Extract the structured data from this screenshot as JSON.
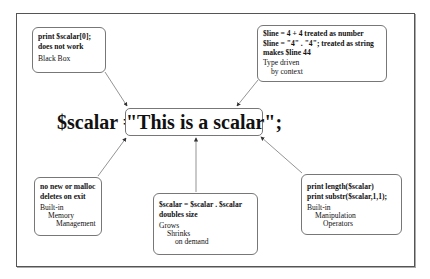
{
  "diagram": {
    "center": {
      "left_text": "$scalar =",
      "boxed_text": "\"This is a scalar\";"
    },
    "notes": {
      "top_left": {
        "code_lines": [
          "print $scalar[0];",
          "does not work"
        ],
        "label_lines": [
          "Black Box"
        ]
      },
      "top_right": {
        "code_lines": [
          "$line = 4 + 4 treated as number",
          "$line = \"4\" . \"4\"; treated as string",
          "makes $line 44"
        ],
        "label_lines": [
          "Type driven",
          "by context"
        ]
      },
      "bottom_left": {
        "code_lines": [
          "no new or malloc",
          "deletes on exit"
        ],
        "label_lines": [
          "Built-in",
          "Memory",
          "Management"
        ]
      },
      "bottom_center": {
        "code_lines": [
          "$scalar = $scalar . $scalar",
          "doubles size"
        ],
        "label_lines": [
          "Grows",
          "Shrinks",
          "on demand"
        ]
      },
      "bottom_right": {
        "code_lines": [
          "print length($scalar)",
          "print substr($scalar,1,1);"
        ],
        "label_lines": [
          "Built-in",
          "Manipulation",
          "Operators"
        ]
      }
    },
    "colors": {
      "border": "#777777",
      "text": "#111111",
      "arrow": "#555555"
    }
  }
}
